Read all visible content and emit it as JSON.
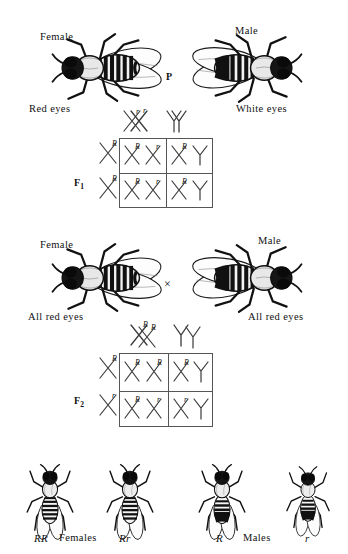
{
  "figure": {
    "background_color": "#ffffff",
    "ink_color": "#000000"
  },
  "generations": {
    "p_label": "P",
    "f1_label": "F",
    "f1_sub": "1",
    "f2_label": "F",
    "f2_sub": "2"
  },
  "parental": {
    "female": {
      "sex_label": "Female",
      "phenotype_label": "Red eyes",
      "icon": "drosophila-female-red-eyed"
    },
    "male": {
      "sex_label": "Male",
      "phenotype_label": "White eyes",
      "icon": "drosophila-male-white-eyed"
    },
    "gametes": [
      {
        "chromosome": "X",
        "allele": "r"
      },
      {
        "chromosome": "Y",
        "allele": ""
      }
    ]
  },
  "f1_square": {
    "top_gametes": [
      {
        "chromosome": "X",
        "allele": "r"
      },
      {
        "chromosome": "Y",
        "allele": ""
      }
    ],
    "side_gametes": [
      {
        "chromosome": "X",
        "allele": "R"
      },
      {
        "chromosome": "X",
        "allele": "R"
      }
    ],
    "cells": [
      [
        {
          "left": {
            "chromosome": "X",
            "allele": "R"
          },
          "right": {
            "chromosome": "X",
            "allele": "r"
          }
        },
        {
          "left": {
            "chromosome": "X",
            "allele": "R"
          },
          "right": {
            "chromosome": "Y",
            "allele": ""
          }
        }
      ],
      [
        {
          "left": {
            "chromosome": "X",
            "allele": "R"
          },
          "right": {
            "chromosome": "X",
            "allele": "r"
          }
        },
        {
          "left": {
            "chromosome": "X",
            "allele": "R"
          },
          "right": {
            "chromosome": "Y",
            "allele": ""
          }
        }
      ]
    ]
  },
  "f1_offspring": {
    "female": {
      "sex_label": "Female",
      "phenotype_label": "All red eyes",
      "icon": "drosophila-female-red-eyed"
    },
    "male": {
      "sex_label": "Male",
      "phenotype_label": "All red eyes",
      "icon": "drosophila-male-red-eyed"
    },
    "cross_symbol": "×",
    "gametes": [
      {
        "chromosome": "X",
        "allele": "R"
      },
      {
        "chromosome": "Y",
        "allele": ""
      }
    ]
  },
  "f2_square": {
    "top_gametes": [
      {
        "chromosome": "X",
        "allele": "R"
      },
      {
        "chromosome": "Y",
        "allele": ""
      }
    ],
    "side_gametes": [
      {
        "chromosome": "X",
        "allele": "R"
      },
      {
        "chromosome": "X",
        "allele": "r"
      }
    ],
    "cells": [
      [
        {
          "left": {
            "chromosome": "X",
            "allele": "R"
          },
          "right": {
            "chromosome": "X",
            "allele": "R"
          }
        },
        {
          "left": {
            "chromosome": "X",
            "allele": "R"
          },
          "right": {
            "chromosome": "Y",
            "allele": ""
          }
        }
      ],
      [
        {
          "left": {
            "chromosome": "X",
            "allele": "R"
          },
          "right": {
            "chromosome": "X",
            "allele": "r"
          }
        },
        {
          "left": {
            "chromosome": "X",
            "allele": "r"
          },
          "right": {
            "chromosome": "Y",
            "allele": ""
          }
        }
      ]
    ]
  },
  "f2_offspring": {
    "group_female_label": "Females",
    "group_male_label": "Males",
    "flies": [
      {
        "genotype": "RR",
        "sex": "female",
        "icon": "drosophila-female-small"
      },
      {
        "genotype": "Rr",
        "sex": "female",
        "icon": "drosophila-female-small"
      },
      {
        "genotype": "R",
        "sex": "male",
        "icon": "drosophila-male-small"
      },
      {
        "genotype": "r",
        "sex": "male",
        "icon": "drosophila-male-small"
      }
    ]
  }
}
